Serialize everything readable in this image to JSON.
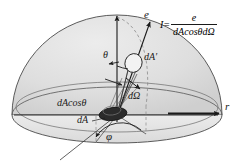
{
  "figure": {
    "colors": {
      "stroke": "#3a3a3a",
      "dome_fill": "#dcdcdc",
      "base_fill": "#e8e8e8",
      "patch_fill": "#2b2b2b",
      "text": "#1a1a1a"
    },
    "labels": {
      "ray_vector": "e",
      "radius_axis": "r",
      "polar_angle": "θ",
      "azimuth_angle": "φ",
      "projected_patch": "dA′",
      "solid_angle": "dΩ",
      "projected_area": "dAcosθ",
      "area_element": "dA"
    },
    "formula": {
      "lhs": "I=",
      "numerator": "e",
      "denominator": "dAcosθdΩ"
    }
  }
}
